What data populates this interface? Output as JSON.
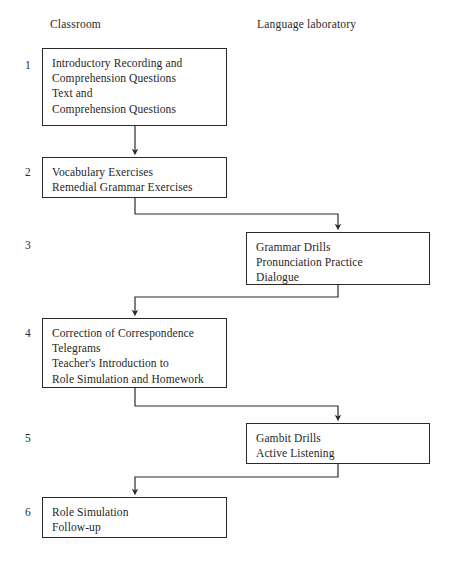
{
  "diagram": {
    "width": 451,
    "height": 564,
    "line_color": "#2a2a2a",
    "background_color": "#fefefe",
    "text_color": "#1f1f1f"
  },
  "columns": {
    "left_header": "Classroom",
    "right_header": "Language laboratory"
  },
  "steps": [
    {
      "number": "1",
      "column": "classroom",
      "lines": [
        "Introductory Recording and",
        "Comprehension Questions",
        "Text and",
        "Comprehension Questions"
      ]
    },
    {
      "number": "2",
      "column": "classroom",
      "lines": [
        "Vocabulary Exercises",
        "Remedial Grammar Exercises"
      ]
    },
    {
      "number": "3",
      "column": "language-laboratory",
      "lines": [
        "Grammar Drills",
        "Pronunciation Practice",
        "Dialogue"
      ]
    },
    {
      "number": "4",
      "column": "classroom",
      "lines": [
        "Correction of Correspondence",
        "Telegrams",
        "Teacher's Introduction to",
        "Role Simulation and Homework"
      ]
    },
    {
      "number": "5",
      "column": "language-laboratory",
      "lines": [
        "Gambit Drills",
        "Active Listening"
      ]
    },
    {
      "number": "6",
      "column": "classroom",
      "lines": [
        "Role Simulation",
        "Follow-up"
      ]
    }
  ],
  "flow": {
    "edges": [
      {
        "from": "1",
        "to": "2",
        "kind": "straight-down"
      },
      {
        "from": "2",
        "to": "3",
        "kind": "step-right"
      },
      {
        "from": "3",
        "to": "4",
        "kind": "step-left"
      },
      {
        "from": "4",
        "to": "5",
        "kind": "step-right"
      },
      {
        "from": "5",
        "to": "6",
        "kind": "step-left"
      }
    ]
  }
}
